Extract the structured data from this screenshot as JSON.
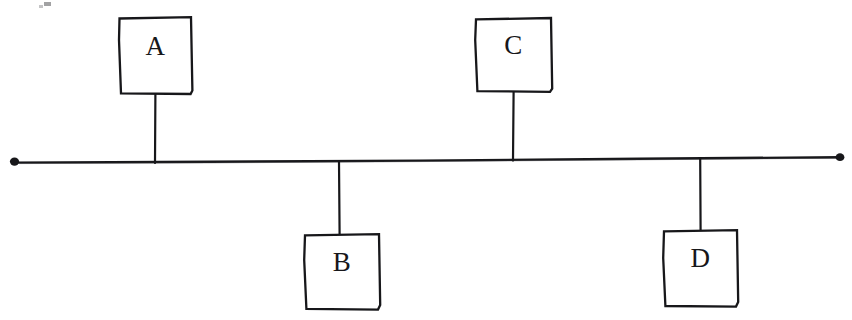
{
  "diagram": {
    "type": "bus-topology",
    "background_color": "#ffffff",
    "ink_color": "#17171a",
    "bus": {
      "name": "bus-backbone-line",
      "orientation": "horizontal",
      "x_start": 13,
      "y_start": 163,
      "x_end": 841,
      "y_end": 157,
      "stroke_width": 2.4,
      "left_terminator": {
        "name": "bus-terminator-left",
        "x": 13,
        "y": 162,
        "shape": "dot"
      },
      "right_terminator": {
        "name": "bus-terminator-right",
        "x": 841,
        "y": 157,
        "shape": "dot"
      }
    },
    "nodes": [
      {
        "id": "A",
        "label": "A",
        "position": "above",
        "box": {
          "x": 119,
          "y": 17,
          "width": 73,
          "height": 77
        },
        "label_pos": {
          "x": 119,
          "y": 33,
          "width": 73
        },
        "drop_line": {
          "x": 155,
          "y_from": 94,
          "y_to": 163
        }
      },
      {
        "id": "B",
        "label": "B",
        "position": "below",
        "box": {
          "x": 304,
          "y": 234,
          "width": 76,
          "height": 76
        },
        "label_pos": {
          "x": 304,
          "y": 249,
          "width": 76
        },
        "drop_line": {
          "x": 339,
          "y_from": 162,
          "y_to": 234
        }
      },
      {
        "id": "C",
        "label": "C",
        "position": "above",
        "box": {
          "x": 475,
          "y": 18,
          "width": 77,
          "height": 74
        },
        "label_pos": {
          "x": 475,
          "y": 32,
          "width": 77
        },
        "drop_line": {
          "x": 513,
          "y_from": 92,
          "y_to": 160
        }
      },
      {
        "id": "D",
        "label": "D",
        "position": "below",
        "box": {
          "x": 663,
          "y": 230,
          "width": 75,
          "height": 77
        },
        "label_pos": {
          "x": 663,
          "y": 245,
          "width": 75
        },
        "drop_line": {
          "x": 700,
          "y_from": 158,
          "y_to": 230
        }
      }
    ],
    "artifacts": [
      {
        "name": "scan-speck-top-left",
        "x": 44,
        "y": 2,
        "width": 7,
        "height": 4
      },
      {
        "name": "scan-speck-top-left-2",
        "x": 39,
        "y": 5,
        "width": 4,
        "height": 3
      }
    ]
  }
}
